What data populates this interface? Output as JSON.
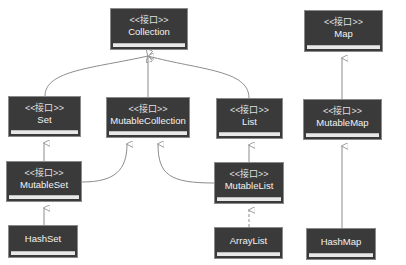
{
  "diagram": {
    "type": "uml-class-hierarchy",
    "stereotype": "<<接口>>",
    "nodes": {
      "collection": {
        "stereotype": "<<接口>>",
        "name": "Collection"
      },
      "set": {
        "stereotype": "<<接口>>",
        "name": "Set"
      },
      "mutable_collection": {
        "stereotype": "<<接口>>",
        "name": "MutableCollection"
      },
      "list": {
        "stereotype": "<<接口>>",
        "name": "List"
      },
      "mutable_set": {
        "stereotype": "<<接口>>",
        "name": "MutableSet"
      },
      "mutable_list": {
        "stereotype": "<<接口>>",
        "name": "MutableList"
      },
      "hash_set": {
        "stereotype": "",
        "name": "HashSet"
      },
      "array_list": {
        "stereotype": "",
        "name": "ArrayList"
      },
      "map": {
        "stereotype": "<<接口>>",
        "name": "Map"
      },
      "mutable_map": {
        "stereotype": "<<接口>>",
        "name": "MutableMap"
      },
      "hash_map": {
        "stereotype": "",
        "name": "HashMap"
      }
    },
    "edges": [
      {
        "from": "Set",
        "to": "Collection",
        "style": "solid",
        "arrow": "hollow-triangle"
      },
      {
        "from": "MutableCollection",
        "to": "Collection",
        "style": "solid",
        "arrow": "hollow-triangle"
      },
      {
        "from": "List",
        "to": "Collection",
        "style": "solid",
        "arrow": "hollow-triangle"
      },
      {
        "from": "MutableSet",
        "to": "Set",
        "style": "solid",
        "arrow": "hollow-triangle"
      },
      {
        "from": "MutableSet",
        "to": "MutableCollection",
        "style": "solid",
        "arrow": "hollow-triangle"
      },
      {
        "from": "MutableList",
        "to": "MutableCollection",
        "style": "solid",
        "arrow": "hollow-triangle"
      },
      {
        "from": "MutableList",
        "to": "List",
        "style": "solid",
        "arrow": "hollow-triangle"
      },
      {
        "from": "HashSet",
        "to": "MutableSet",
        "style": "solid",
        "arrow": "hollow-triangle"
      },
      {
        "from": "ArrayList",
        "to": "MutableList",
        "style": "dashed",
        "arrow": "hollow-triangle"
      },
      {
        "from": "MutableMap",
        "to": "Map",
        "style": "solid",
        "arrow": "hollow-triangle"
      },
      {
        "from": "HashMap",
        "to": "MutableMap",
        "style": "solid",
        "arrow": "hollow-triangle"
      }
    ],
    "colors": {
      "node_fill": "#3a3a3a",
      "node_text": "#eeeeee",
      "edge": "#8c8c8c",
      "background": "#ffffff"
    }
  }
}
